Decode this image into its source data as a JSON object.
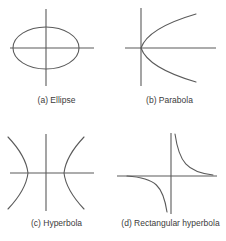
{
  "figure": {
    "background_color": "#ffffff",
    "stroke_color": "#5a5a5a",
    "axis_color": "#5a5a5a",
    "caption_color": "#3b3b3b",
    "panels": [
      {
        "id": "a",
        "key": "ellipse",
        "caption": "(a) Ellipse",
        "curve_type": "ellipse",
        "description": "Closed oval centred on the origin, wider than tall",
        "axes": {
          "x_axis": true,
          "y_axis": true,
          "origin_centered": true
        },
        "geometry": {
          "semi_major_x": 33,
          "semi_minor_y": 21
        }
      },
      {
        "id": "b",
        "key": "parabola",
        "caption": "(b) Parabola",
        "curve_type": "parabola",
        "description": "Opens to the right with its vertex at the origin",
        "axes": {
          "x_axis": true,
          "y_axis": true,
          "origin_centered": false
        },
        "geometry": {
          "opens": "right",
          "vertex_at_origin": true
        }
      },
      {
        "id": "c",
        "key": "hyperbola",
        "caption": "(c) Hyperbola",
        "curve_type": "hyperbola",
        "description": "Two branches opening left and right, vertices on the x-axis",
        "axes": {
          "x_axis": true,
          "y_axis": true,
          "origin_centered": true
        },
        "geometry": {
          "branches": 2,
          "opens": "left-right",
          "vertex_offset_x": 18
        }
      },
      {
        "id": "d",
        "key": "rectangular-hyperbola",
        "caption": "(d) Rectangular hyperbola",
        "curve_type": "rectangular-hyperbola",
        "description": "Branches in the first and third quadrants, asymptotic to both axes",
        "axes": {
          "x_axis": true,
          "y_axis": true,
          "origin_centered": false
        },
        "geometry": {
          "branches": 2,
          "quadrants": [
            1,
            3
          ]
        }
      }
    ]
  }
}
